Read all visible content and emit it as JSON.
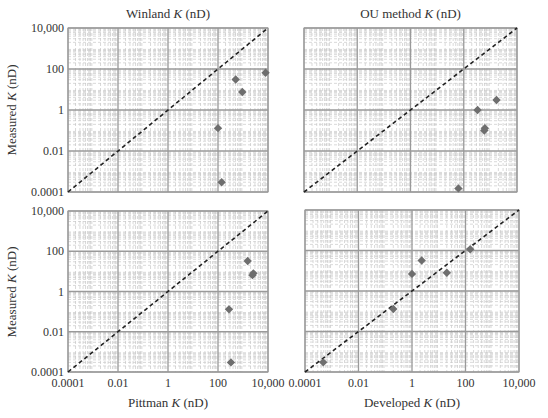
{
  "figure": {
    "ylabel_top": "Measured K (nD)",
    "ylabel_bottom": "Measured K (nD)"
  },
  "chart_data": [
    {
      "type": "scatter",
      "title": "Winland K (nD)",
      "xlabel": "",
      "ylabel": "Measured K (nD)",
      "xscale": "log",
      "yscale": "log",
      "xlim": [
        0.0001,
        10000
      ],
      "ylim": [
        0.0001,
        10000
      ],
      "xticks": [
        "0.0001",
        "0.01",
        "1",
        "100",
        "10,000"
      ],
      "yticks": [
        "0.0001",
        "0.01",
        "1",
        "100",
        "10,000"
      ],
      "show_xticklabels": false,
      "show_yticklabels": true,
      "grid": true,
      "reference_line": "1:1 dashed",
      "points": [
        {
          "x": 8000,
          "y": 66
        },
        {
          "x": 510,
          "y": 31
        },
        {
          "x": 940,
          "y": 7.6
        },
        {
          "x": 100,
          "y": 0.13
        },
        {
          "x": 140,
          "y": 0.0003
        }
      ]
    },
    {
      "type": "scatter",
      "title": "OU method K (nD)",
      "xlabel": "",
      "ylabel": "",
      "xscale": "log",
      "yscale": "log",
      "xlim": [
        0.0001,
        10000
      ],
      "ylim": [
        0.0001,
        10000
      ],
      "xticks": [
        "0.0001",
        "0.01",
        "1",
        "100",
        "10,000"
      ],
      "yticks": [
        "0.0001",
        "0.01",
        "1",
        "100",
        "10,000"
      ],
      "show_xticklabels": false,
      "show_yticklabels": false,
      "grid": true,
      "reference_line": "1:1 dashed",
      "points": [
        {
          "x": 1700,
          "y": 3.1
        },
        {
          "x": 330,
          "y": 1.0
        },
        {
          "x": 590,
          "y": 0.1
        },
        {
          "x": 620,
          "y": 0.13
        },
        {
          "x": 63,
          "y": 0.00015
        }
      ]
    },
    {
      "type": "scatter",
      "title": "",
      "xlabel": "Pittman K (nD)",
      "ylabel": "Measured K (nD)",
      "xscale": "log",
      "yscale": "log",
      "xlim": [
        0.0001,
        10000
      ],
      "ylim": [
        0.0001,
        10000
      ],
      "xticks": [
        "0.0001",
        "0.01",
        "1",
        "100",
        "10,000"
      ],
      "yticks": [
        "0.0001",
        "0.01",
        "1",
        "100",
        "10,000"
      ],
      "show_xticklabels": true,
      "show_yticklabels": true,
      "grid": true,
      "reference_line": "1:1 dashed",
      "points": [
        {
          "x": 1540,
          "y": 33
        },
        {
          "x": 2600,
          "y": 8
        },
        {
          "x": 2400,
          "y": 6.5
        },
        {
          "x": 275,
          "y": 0.13
        },
        {
          "x": 330,
          "y": 0.0003
        }
      ]
    },
    {
      "type": "scatter",
      "title": "",
      "xlabel": "Developed K (nD)",
      "ylabel": "",
      "xscale": "log",
      "yscale": "log",
      "xlim": [
        0.0001,
        10000
      ],
      "ylim": [
        0.0001,
        10000
      ],
      "xticks": [
        "0.0001",
        "0.01",
        "1",
        "100",
        "10,000"
      ],
      "yticks": [
        "0.0001",
        "0.01",
        "1",
        "100",
        "10,000"
      ],
      "show_xticklabels": true,
      "show_yticklabels": false,
      "grid": true,
      "reference_line": "1:1 dashed",
      "points": [
        {
          "x": 0.00048,
          "y": 0.0003
        },
        {
          "x": 0.2,
          "y": 0.13
        },
        {
          "x": 1.0,
          "y": 7
        },
        {
          "x": 2.3,
          "y": 32
        },
        {
          "x": 20,
          "y": 8
        },
        {
          "x": 150,
          "y": 115
        }
      ]
    }
  ],
  "colors": {
    "marker": "#6e6e6e",
    "major_grid": "#9a9a9a",
    "minor_grid": "#c8c8c8",
    "reference_line": "#222222",
    "text": "#333333"
  }
}
